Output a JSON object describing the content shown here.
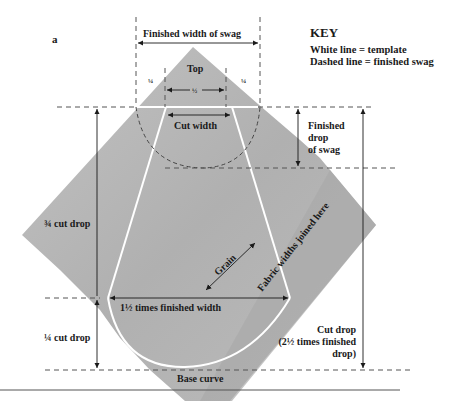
{
  "figure_label": "a",
  "key": {
    "title": "KEY",
    "lines": [
      "White line = template",
      "Dashed line = finished swag"
    ]
  },
  "labels": {
    "finished_width": "Finished width of swag",
    "top": "Top",
    "quarter_left": "¼",
    "half": "½",
    "quarter_right": "¼",
    "cut_width": "Cut width",
    "finished_drop": [
      "Finished",
      "drop",
      "of swag"
    ],
    "three_quarter_cut_drop": "¾ cut drop",
    "quarter_cut_drop": "¼ cut drop",
    "grain": "Grain",
    "fabric_join": "Fabric widths joined here",
    "one_and_half_width": "1½ times finished width",
    "cut_drop": [
      "Cut drop",
      "(2½ times finished",
      "drop)"
    ],
    "base_curve": "Base curve"
  },
  "colors": {
    "fabric": "#b4b4b4",
    "fabric_dark": "#a6a6a6",
    "template_line": "#ffffff",
    "dashed_line": "#555555",
    "text": "#1a1a1a"
  }
}
